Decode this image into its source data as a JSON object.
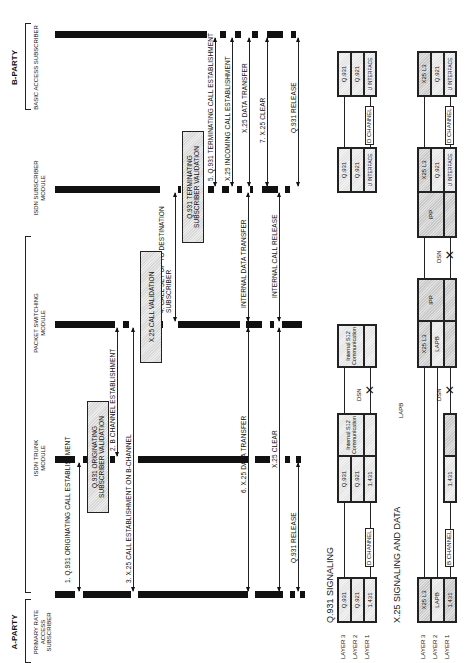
{
  "parties": {
    "a_party": {
      "label": "A-PARTY",
      "subscriber": "PRIMARY RATE ACCESS SUBSCRIBER"
    },
    "b_party": {
      "label": "B-PARTY",
      "subscriber": "BASIC ACCESS SUBSCRIBER"
    }
  },
  "modules": {
    "isdn_trunk": "ISDN TRUNK MODULE",
    "packet_switching": "PACKET SWITCHING MODULE",
    "isdn_subscriber": "ISDN SUBSCRIBER MODULE"
  },
  "boxes": {
    "q931_orig_validation": "Q.931 ORIGINATING SUBSCRIBER VALIDATION",
    "x25_call_validation": "X.25 CALL VALIDATION",
    "q931_term_validation": "Q.931 TERMINATING SUBSCRIBER VALIDATION"
  },
  "messages": [
    {
      "id": "m1",
      "label": "1. Q.931 ORIGINATING CALL ESTABLISHMENT"
    },
    {
      "id": "m2",
      "label": "2. B CHANNEL ESTABLISHMENT"
    },
    {
      "id": "m3",
      "label": "3. X.25 CALL ESTABLISHMENT ON B-CHANNEL"
    },
    {
      "id": "m4",
      "label": "4. CALL SET UP TO DESTINATION SUBSCRIBER"
    },
    {
      "id": "m5",
      "label": "5. Q.931 TERMINATING CALL ESTABLISHMENT"
    },
    {
      "id": "m5b",
      "label": "X.25 INCOMING CALL ESTABLISHMENT"
    },
    {
      "id": "m5c",
      "label": "X.25 DATA TRANSFER"
    },
    {
      "id": "m6",
      "label": "6. X.25 DATA TRANSFER"
    },
    {
      "id": "m6b",
      "label": "INTERNAL DATA TRANSFER"
    },
    {
      "id": "m7",
      "label": "7. X.25 CLEAR"
    },
    {
      "id": "m7b",
      "label": "X.25 CLEAR"
    },
    {
      "id": "m7c",
      "label": "INTERNAL CALL RELEASE"
    },
    {
      "id": "m8",
      "label": "Q.931 RELEASE"
    },
    {
      "id": "m8b",
      "label": "Q.931 RELEASE"
    }
  ],
  "q931_section": {
    "title": "Q.931 SIGNALING",
    "layers": [
      "LAYER 3",
      "LAYER 2",
      "LAYER 1"
    ],
    "stack_a": [
      "Q.931",
      "Q.921",
      "1.431"
    ],
    "stack_trunk": [
      "Q.931",
      "Q.921",
      "1.431"
    ],
    "trunk_internal": "Internal S12 Communication",
    "psm_internal": "Internal S12 Communication",
    "stack_sub": [
      "Q.931",
      "Q.921",
      "U INTERFACE"
    ],
    "stack_b": [
      "Q.931",
      "Q.921",
      "U INTERFACE"
    ],
    "channel_1": "D CHANNEL",
    "channel_2": "D CHANNEL",
    "dsn": "DSN"
  },
  "x25_section": {
    "title": "X.25 SIGNALING AND DATA",
    "layers": [
      "LAYER 3",
      "LAYER 2",
      "LAYER 1"
    ],
    "stack_a": [
      "X25 L3",
      "LAPB",
      "1.431"
    ],
    "stack_trunk_l1": "1.431",
    "lapb_floating": "LAPB",
    "stack_psm": [
      "X25 L3",
      "LAPB"
    ],
    "psm_ipp": "IPP",
    "sub_ipp": "IPP",
    "stack_sub": [
      "X25 L3",
      "Q.921",
      "U INTERFACE"
    ],
    "stack_b": [
      "X25 L3",
      "Q.921",
      "U INTERFACE"
    ],
    "channel_1": "B CHANNEL",
    "channel_2": "D CHANNEL",
    "dsn_1": "DSN",
    "dsn_2": "DSN"
  }
}
